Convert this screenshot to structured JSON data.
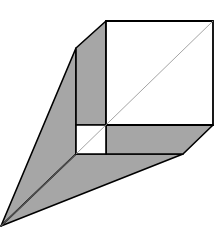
{
  "diagram": {
    "title": "",
    "colors": {
      "shade": "#a6a6a6",
      "face": "#ffffff",
      "stroke": "#000000",
      "diagonal": "#9a9a9a"
    },
    "shapes": [
      {
        "name": "large-square",
        "points": "106,21 213,21 213,125 106,125"
      },
      {
        "name": "small-square",
        "points": "76,125 106,125 106,154 76,154"
      },
      {
        "name": "left-band",
        "points": "76,48 106,21 106,125 76,125"
      },
      {
        "name": "bottom-band",
        "points": "106,125 213,125 183,154 106,154"
      },
      {
        "name": "left-fin",
        "points": "76,48 76,154 1,226"
      },
      {
        "name": "bottom-fin",
        "points": "76,154 183,154 1,226"
      }
    ],
    "diagonal": {
      "x1": 76,
      "y1": 154,
      "x2": 213,
      "y2": 21
    },
    "apex": {
      "x": 1,
      "y": 226
    }
  }
}
